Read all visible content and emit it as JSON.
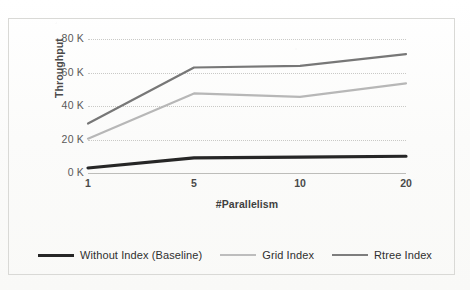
{
  "chart_data": {
    "type": "line",
    "title": "",
    "xlabel": "#Parallelism",
    "ylabel": "Throughput",
    "categories": [
      "1",
      "5",
      "10",
      "20"
    ],
    "x_tick_labels": [
      "1",
      "5",
      "10",
      "20"
    ],
    "y_tick_labels": [
      "0 K",
      "20 K",
      "40 K",
      "60 K",
      "80 K"
    ],
    "y_tick_values": [
      0,
      20000,
      40000,
      60000,
      80000
    ],
    "ylim": [
      0,
      80000
    ],
    "grid": true,
    "legend_position": "bottom",
    "series": [
      {
        "name": "Without Index (Baseline)",
        "color": "#262626",
        "width": 3.2,
        "values": [
          3000,
          9000,
          9500,
          10000
        ]
      },
      {
        "name": "Grid Index",
        "color": "#b7b7b7",
        "width": 2.2,
        "values": [
          20500,
          47500,
          45500,
          53500
        ]
      },
      {
        "name": "Rtree Index",
        "color": "#777777",
        "width": 2.2,
        "values": [
          29500,
          63000,
          64000,
          71000
        ]
      }
    ]
  },
  "legend": {
    "items": [
      {
        "label": "Without Index (Baseline)",
        "color": "#262626",
        "width": 3.4
      },
      {
        "label": "Grid Index",
        "color": "#bdbdbd",
        "width": 2.4
      },
      {
        "label": "Rtree Index",
        "color": "#7d7d7d",
        "width": 2.6
      }
    ]
  },
  "axes": {
    "y_title": "Throughput",
    "x_title": "#Parallelism"
  },
  "colors": {
    "background": "#fcfcfb",
    "frame": "#d9d9d6",
    "gridline": "#c9c9c6",
    "tick_text": "#4a4a4a"
  }
}
